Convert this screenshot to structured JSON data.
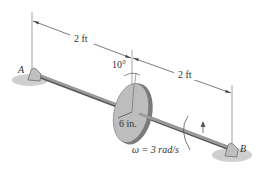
{
  "diagram": {
    "labels": {
      "support_a": "A",
      "support_b": "B",
      "dim_left": "2 ft",
      "dim_right": "2 ft",
      "angle": "10°",
      "radius": "6 in.",
      "omega": "ω = 3 rad/s"
    },
    "colors": {
      "shaft": "#8a8a8a",
      "shaft_dark": "#555555",
      "disk_face": "#b9b9b9",
      "disk_edge": "#7a7a7a",
      "shadow": "#c9c9c9",
      "line": "#444444",
      "text": "#333333"
    }
  }
}
